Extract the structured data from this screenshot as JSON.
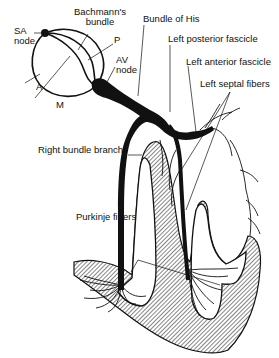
{
  "diagram": {
    "labels": {
      "sa_node": "SA\nnode",
      "sa_node_line1": "SA",
      "sa_node_line2": "node",
      "bachmann_line1": "Bachmann's",
      "bachmann_line2": "bundle",
      "p": "P",
      "av_node_line1": "AV",
      "av_node_line2": "node",
      "a": "A",
      "m": "M",
      "bundle_of_his": "Bundle of His",
      "left_posterior_fascicle": "Left posterior fascicle",
      "left_anterior_fascicle": "Left anterior fascicle",
      "left_septal_fibers": "Left septal fibers",
      "right_bundle_branch": "Right bundle branch",
      "purkinje_fibers": "Purkinje fibers"
    },
    "colors": {
      "ink": "#111111",
      "background": "#ffffff",
      "hatch": "#555555"
    }
  }
}
